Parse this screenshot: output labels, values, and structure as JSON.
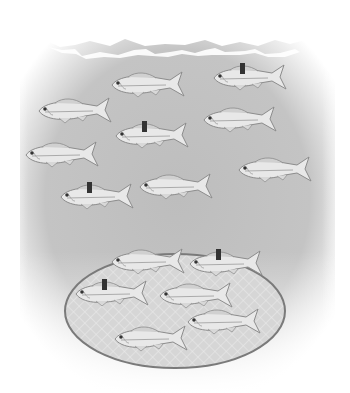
{
  "illustration": {
    "subject": "mark-recapture fish sampling",
    "colors": {
      "water": "#b9b9b9",
      "surface_foam": "#ffffff",
      "fish_body": "#e6e6e6",
      "fish_outline": "#8a8a8a",
      "tag": "#333333",
      "net_fill": "#d4d4d4",
      "net_outline": "#777777"
    },
    "open_water_fish": [
      {
        "x": 108,
        "y": 70,
        "tagged": false
      },
      {
        "x": 210,
        "y": 63,
        "tagged": true
      },
      {
        "x": 35,
        "y": 96,
        "tagged": false
      },
      {
        "x": 200,
        "y": 105,
        "tagged": false
      },
      {
        "x": 112,
        "y": 121,
        "tagged": true
      },
      {
        "x": 22,
        "y": 140,
        "tagged": false
      },
      {
        "x": 235,
        "y": 155,
        "tagged": false
      },
      {
        "x": 136,
        "y": 172,
        "tagged": false
      },
      {
        "x": 57,
        "y": 182,
        "tagged": true
      }
    ],
    "net": {
      "cx": 175,
      "cy": 311,
      "rx": 110,
      "ry": 57
    },
    "netted_fish": [
      {
        "x": 108,
        "y": 247,
        "tagged": false
      },
      {
        "x": 186,
        "y": 249,
        "tagged": true
      },
      {
        "x": 72,
        "y": 279,
        "tagged": true
      },
      {
        "x": 156,
        "y": 281,
        "tagged": false
      },
      {
        "x": 184,
        "y": 307,
        "tagged": false
      },
      {
        "x": 111,
        "y": 324,
        "tagged": false
      }
    ]
  }
}
